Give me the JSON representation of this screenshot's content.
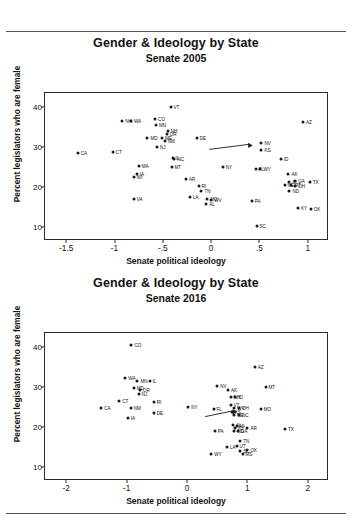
{
  "figures": [
    {
      "title": "Gender & Ideology by State",
      "subtitle": "Senate 2005",
      "xlabel": "Senate political ideology",
      "ylabel": "Percent legislators who are female"
    },
    {
      "title": "Gender & Ideology by State",
      "subtitle": "Senate 2016",
      "xlabel": "Senate political ideology",
      "ylabel": "Percent legislators who are female"
    }
  ],
  "chart_data": [
    {
      "type": "scatter",
      "title": "Gender & Ideology by State",
      "subtitle": "Senate 2005",
      "xlabel": "Senate political ideology",
      "ylabel": "Percent legislators who are female",
      "xlim": [
        -1.72,
        1.22
      ],
      "ylim": [
        6.5,
        43.5
      ],
      "xticks": [
        -1.5,
        -1,
        -0.5,
        0,
        0.5,
        1
      ],
      "xticklabels": [
        "-1.5",
        "-1",
        "-.5",
        "0",
        ".5",
        "1"
      ],
      "yticks": [
        10,
        20,
        30,
        40
      ],
      "yticklabels": [
        "10",
        "20",
        "30",
        "40"
      ],
      "grid": false,
      "legend": "none",
      "annotations": [
        {
          "type": "arrow",
          "x0": -0.02,
          "y0": 29.4,
          "x1": 0.43,
          "y1": 30.4
        }
      ],
      "points": [
        {
          "label": "VT",
          "x": -0.42,
          "y": 40.0,
          "lx": "right"
        },
        {
          "label": "AZ",
          "x": 0.95,
          "y": 36.3,
          "lx": "right"
        },
        {
          "label": "NH",
          "x": -0.92,
          "y": 36.4,
          "lx": "right"
        },
        {
          "label": "WA",
          "x": -0.83,
          "y": 36.4,
          "lx": "right"
        },
        {
          "label": "CO",
          "x": -0.58,
          "y": 36.9,
          "lx": "right"
        },
        {
          "label": "MN",
          "x": -0.57,
          "y": 35.6,
          "lx": "right"
        },
        {
          "label": "NH2",
          "x": -0.45,
          "y": 33.9,
          "lx": "right",
          "text": "NH"
        },
        {
          "label": "OR",
          "x": -0.46,
          "y": 33.2,
          "lx": "right"
        },
        {
          "label": "MD",
          "x": -0.66,
          "y": 32.3,
          "lx": "right"
        },
        {
          "label": "ME",
          "x": -0.51,
          "y": 32.3,
          "lx": "right"
        },
        {
          "label": "NM",
          "x": -0.48,
          "y": 31.6,
          "lx": "right"
        },
        {
          "label": "DE",
          "x": -0.15,
          "y": 32.2,
          "lx": "right"
        },
        {
          "label": "NJ",
          "x": -0.56,
          "y": 30.1,
          "lx": "right"
        },
        {
          "label": "NV",
          "x": 0.52,
          "y": 31.0,
          "lx": "right"
        },
        {
          "label": "KS",
          "x": 0.52,
          "y": 29.3,
          "lx": "right"
        },
        {
          "label": "CA",
          "x": -1.38,
          "y": 28.6,
          "lx": "right"
        },
        {
          "label": "CT",
          "x": -1.02,
          "y": 28.8,
          "lx": "right"
        },
        {
          "label": "IL",
          "x": -0.4,
          "y": 27.2,
          "lx": "right"
        },
        {
          "label": "NC",
          "x": -0.38,
          "y": 26.9,
          "lx": "right"
        },
        {
          "label": "ID",
          "x": 0.72,
          "y": 27.0,
          "lx": "right"
        },
        {
          "label": "MA",
          "x": -0.75,
          "y": 25.2,
          "lx": "right"
        },
        {
          "label": "MT",
          "x": -0.41,
          "y": 25.0,
          "lx": "right"
        },
        {
          "label": "NY",
          "x": 0.12,
          "y": 24.9,
          "lx": "right"
        },
        {
          "label": "FL",
          "x": 0.46,
          "y": 24.4,
          "lx": "right"
        },
        {
          "label": "WY",
          "x": 0.51,
          "y": 24.6,
          "lx": "right"
        },
        {
          "label": "WI",
          "x": -0.8,
          "y": 22.6,
          "lx": "right"
        },
        {
          "label": "IA",
          "x": -0.77,
          "y": 23.3,
          "lx": "right"
        },
        {
          "label": "AK",
          "x": 0.8,
          "y": 23.2,
          "lx": "right"
        },
        {
          "label": "RI",
          "x": -0.13,
          "y": 20.3,
          "lx": "right"
        },
        {
          "label": "GA",
          "x": 0.87,
          "y": 21.5,
          "lx": "right"
        },
        {
          "label": "LA2",
          "x": 0.81,
          "y": 21.2,
          "lx": "right",
          "text": "IN"
        },
        {
          "label": "TX",
          "x": 1.02,
          "y": 21.2,
          "lx": "right"
        },
        {
          "label": "NE",
          "x": 0.76,
          "y": 20.4,
          "lx": "right"
        },
        {
          "label": "KY2",
          "x": 0.83,
          "y": 20.6,
          "lx": "right",
          "text": "MT"
        },
        {
          "label": "OH",
          "x": 0.87,
          "y": 20.3,
          "lx": "right"
        },
        {
          "label": "TN",
          "x": -0.1,
          "y": 19.0,
          "lx": "right"
        },
        {
          "label": "ND",
          "x": 0.81,
          "y": 19.1,
          "lx": "right"
        },
        {
          "label": "AR",
          "x": -0.26,
          "y": 22.0,
          "lx": "right"
        },
        {
          "label": "VA",
          "x": -0.8,
          "y": 17.0,
          "lx": "right"
        },
        {
          "label": "MO",
          "x": -0.04,
          "y": 17.0,
          "lx": "right"
        },
        {
          "label": "WV",
          "x": 0.0,
          "y": 16.7,
          "lx": "right"
        },
        {
          "label": "LA",
          "x": -0.22,
          "y": 17.6,
          "lx": "right"
        },
        {
          "label": "AL",
          "x": -0.05,
          "y": 15.8,
          "lx": "right"
        },
        {
          "label": "PA",
          "x": 0.42,
          "y": 16.6,
          "lx": "right"
        },
        {
          "label": "KY",
          "x": 0.9,
          "y": 14.8,
          "lx": "right"
        },
        {
          "label": "OK",
          "x": 1.03,
          "y": 14.6,
          "lx": "right"
        },
        {
          "label": "SC",
          "x": 0.47,
          "y": 10.3,
          "lx": "right"
        }
      ]
    },
    {
      "type": "scatter",
      "title": "Gender & Ideology by State",
      "subtitle": "Senate 2016",
      "xlabel": "Senate political ideology",
      "ylabel": "Percent legislators who are female",
      "xlim": [
        -2.35,
        2.35
      ],
      "ylim": [
        6.5,
        43.5
      ],
      "xticks": [
        -2,
        -1,
        0,
        1,
        2
      ],
      "xticklabels": [
        "-2",
        "-1",
        "0",
        "1",
        "2"
      ],
      "yticks": [
        10,
        20,
        30,
        40
      ],
      "yticklabels": [
        "10",
        "20",
        "30",
        "40"
      ],
      "grid": false,
      "legend": "none",
      "annotations": [
        {
          "type": "arrow",
          "x0": 0.3,
          "y0": 22.6,
          "x1": 0.83,
          "y1": 23.8
        }
      ],
      "points": [
        {
          "label": "CO",
          "x": -0.92,
          "y": 40.5,
          "lx": "right"
        },
        {
          "label": "AZ",
          "x": 1.12,
          "y": 35.0,
          "lx": "right"
        },
        {
          "label": "WA",
          "x": -1.02,
          "y": 32.3,
          "lx": "right"
        },
        {
          "label": "MN",
          "x": -0.82,
          "y": 31.6,
          "lx": "right"
        },
        {
          "label": "IL",
          "x": -0.62,
          "y": 31.4,
          "lx": "right"
        },
        {
          "label": "NV",
          "x": 0.5,
          "y": 30.3,
          "lx": "right"
        },
        {
          "label": "MT",
          "x": 1.3,
          "y": 29.9,
          "lx": "right"
        },
        {
          "label": "MD",
          "x": -0.88,
          "y": 29.8,
          "lx": "right"
        },
        {
          "label": "OR",
          "x": -0.78,
          "y": 29.2,
          "lx": "right"
        },
        {
          "label": "AK",
          "x": 0.68,
          "y": 29.3,
          "lx": "right"
        },
        {
          "label": "NJ",
          "x": -0.8,
          "y": 28.2,
          "lx": "right"
        },
        {
          "label": "NH",
          "x": 0.72,
          "y": 27.6,
          "lx": "right"
        },
        {
          "label": "ID",
          "x": 0.8,
          "y": 27.4,
          "lx": "right"
        },
        {
          "label": "CT",
          "x": -1.12,
          "y": 26.4,
          "lx": "right"
        },
        {
          "label": "RI",
          "x": -0.55,
          "y": 26.3,
          "lx": "right"
        },
        {
          "label": "CA",
          "x": -1.42,
          "y": 24.7,
          "lx": "right"
        },
        {
          "label": "NM",
          "x": -0.93,
          "y": 24.7,
          "lx": "right"
        },
        {
          "label": "NY",
          "x": 0.02,
          "y": 25.0,
          "lx": "right"
        },
        {
          "label": "FL",
          "x": 0.44,
          "y": 24.6,
          "lx": "right"
        },
        {
          "label": "VT",
          "x": 0.72,
          "y": 25.5,
          "lx": "right"
        },
        {
          "label": "WV",
          "x": 0.78,
          "y": 24.8,
          "lx": "right"
        },
        {
          "label": "OH",
          "x": 0.86,
          "y": 24.7,
          "lx": "right"
        },
        {
          "label": "MO",
          "x": 1.22,
          "y": 24.5,
          "lx": "right"
        },
        {
          "label": "DE",
          "x": -0.55,
          "y": 23.4,
          "lx": "right"
        },
        {
          "label": "KS",
          "x": 0.74,
          "y": 23.8,
          "lx": "right"
        },
        {
          "label": "NE",
          "x": 0.78,
          "y": 23.0,
          "lx": "right"
        },
        {
          "label": "NC",
          "x": 0.86,
          "y": 22.9,
          "lx": "right"
        },
        {
          "label": "IA",
          "x": -0.98,
          "y": 22.2,
          "lx": "right"
        },
        {
          "label": "AL",
          "x": 0.76,
          "y": 20.6,
          "lx": "right"
        },
        {
          "label": "MN2",
          "x": 0.82,
          "y": 20.2,
          "lx": "right",
          "text": "MI"
        },
        {
          "label": "KY",
          "x": 0.8,
          "y": 19.7,
          "lx": "right"
        },
        {
          "label": "AR",
          "x": 1.0,
          "y": 19.8,
          "lx": "right"
        },
        {
          "label": "ND",
          "x": 0.78,
          "y": 19.0,
          "lx": "right"
        },
        {
          "label": "GA",
          "x": 0.84,
          "y": 19.0,
          "lx": "right"
        },
        {
          "label": "PA",
          "x": 0.46,
          "y": 18.9,
          "lx": "right"
        },
        {
          "label": "TX",
          "x": 1.62,
          "y": 19.4,
          "lx": "right"
        },
        {
          "label": "TN",
          "x": 0.88,
          "y": 16.4,
          "lx": "right"
        },
        {
          "label": "LA",
          "x": 0.66,
          "y": 14.9,
          "lx": "right"
        },
        {
          "label": "UT",
          "x": 0.82,
          "y": 15.2,
          "lx": "right"
        },
        {
          "label": "SC",
          "x": 0.88,
          "y": 14.0,
          "lx": "right"
        },
        {
          "label": "OK",
          "x": 1.0,
          "y": 14.2,
          "lx": "right"
        },
        {
          "label": "MS",
          "x": 0.92,
          "y": 13.2,
          "lx": "right"
        },
        {
          "label": "WY",
          "x": 0.4,
          "y": 13.3,
          "lx": "right"
        }
      ]
    }
  ]
}
